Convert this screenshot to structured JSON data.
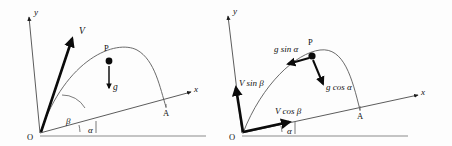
{
  "figure": {
    "background_color": "#fdfdfd",
    "stroke_color": "#111111",
    "ground_color": "#8c8c8c",
    "panel_count": 2
  },
  "panels": [
    {
      "id": "left-panel",
      "name": "velocity-and-gravity-diagram",
      "origin_label": "O",
      "axis_y_label": "y",
      "axis_x_label": "x",
      "point_p_label": "P",
      "point_a_label": "A",
      "angle_beta_label": "β",
      "angle_alpha_label": "α",
      "vector_v_label": "V",
      "vector_g_label": "g",
      "description": "Launch velocity V at angle beta to the inclined x-axis; gravity g acts vertically downward at P on the trajectory."
    },
    {
      "id": "right-panel",
      "name": "component-resolution-diagram",
      "origin_label": "O",
      "axis_y_label": "y",
      "axis_x_label": "x",
      "point_p_label": "P",
      "point_a_label": "A",
      "angle_alpha_label": "α",
      "vector_vsin_label": "V sin β",
      "vector_vcos_label": "V cos β",
      "vector_gsin_label": "g sin α",
      "vector_gcos_label": "g cos α",
      "description": "Velocity resolved into V sin beta along y and V cos beta along the incline; gravity resolved into g sin alpha along the incline and g cos alpha perpendicular to it."
    }
  ]
}
